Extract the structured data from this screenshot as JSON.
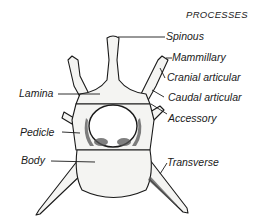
{
  "diagram": {
    "type": "anatomical-illustration",
    "heading": "PROCESSES",
    "labels_right": [
      {
        "id": "spinous",
        "text": "Spinous"
      },
      {
        "id": "mammillary",
        "text": "Mammillary"
      },
      {
        "id": "cranial-articular",
        "text": "Cranial articular"
      },
      {
        "id": "caudal-articular",
        "text": "Caudal articular"
      },
      {
        "id": "accessory",
        "text": "Accessory"
      },
      {
        "id": "transverse",
        "text": "Transverse"
      }
    ],
    "labels_left": [
      {
        "id": "lamina",
        "text": "Lamina"
      },
      {
        "id": "pedicle",
        "text": "Pedicle"
      },
      {
        "id": "body",
        "text": "Body"
      }
    ],
    "colors": {
      "ink": "#1a1a1a",
      "bone": "#f4f4f2",
      "shade": "#555555",
      "background": "#ffffff"
    }
  }
}
